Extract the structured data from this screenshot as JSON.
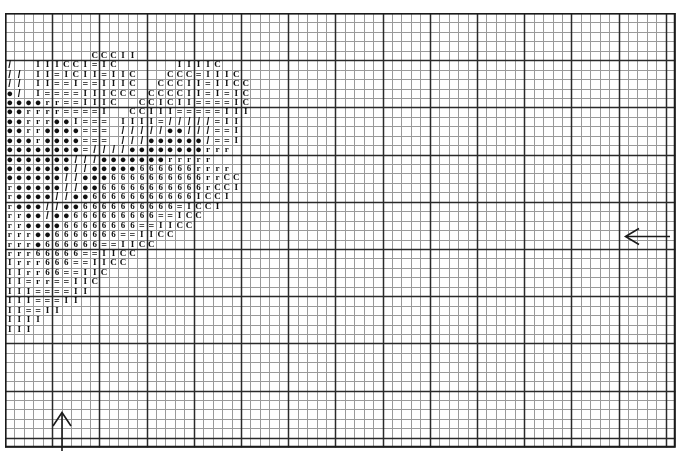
{
  "document": {
    "type": "cross-stitch-pattern-chart",
    "title": "Cross Stitch Pattern Chart",
    "background_color": "#ffffff",
    "ink_color": "#101010"
  },
  "grid": {
    "columns": 71,
    "rows": 46,
    "cell_size_px": 9.44,
    "origin_x_px": 5,
    "origin_y_px": 13,
    "width_px": 671,
    "height_px": 435,
    "minor_line_color": "#9a9a9a",
    "major_line_color": "#2a2a2a",
    "major_line_every": 5,
    "border_color": "#1a1a1a"
  },
  "markers": {
    "center_arrow_right": {
      "label": "vertical-center-marker",
      "direction": "left",
      "x_px": 622,
      "y_px": 236,
      "color": "#1a1a1a"
    },
    "center_arrow_bottom": {
      "label": "horizontal-center-marker",
      "direction": "up",
      "x_px": 62,
      "y_px": 409,
      "color": "#1a1a1a"
    }
  },
  "symbol_legend": [
    {
      "symbol": "C",
      "name": "letter-c-symbol"
    },
    {
      "symbol": "I",
      "name": "letter-i-symbol"
    },
    {
      "symbol": "=",
      "name": "equals-symbol"
    },
    {
      "symbol": "-",
      "name": "dash-symbol"
    },
    {
      "symbol": "/",
      "name": "slash-symbol"
    },
    {
      "symbol": "●",
      "name": "filled-dot-symbol"
    },
    {
      "symbol": "r",
      "name": "letter-r-symbol"
    },
    {
      "symbol": "6",
      "name": "digit-six-symbol"
    },
    {
      "symbol": "0",
      "name": "digit-zero-symbol"
    },
    {
      "symbol": ")",
      "name": "paren-symbol"
    },
    {
      "symbol": "$",
      "name": "dollar-symbol"
    }
  ],
  "chart_data": {
    "type": "heatmap",
    "xlabel": "",
    "ylabel": "",
    "grid": true,
    "legend_position": "none",
    "columns": 71,
    "rows": 46,
    "cells": [
      "",
      "",
      "",
      "",
      "                  C C C I I",
      "/     I I I C C I = I C             I I I I C",
      "/ /   I I = I C I I = I I C       C C C = I I I C",
      "/ /   I I = = I = = I I I C     C C C I I = I I C C",
      "● /   I = = = = I I I C C C   C C C C I I = I = I C",
      "● ● ● ● r r = = I I I C     C C I C I I = = = = I C",
      "● ● r r r r = = = = I     C C I I I = = = = = I I I",
      "● ● r r r ● ● I = = =   I I I I = / / / / / = I I",
      "● ● r r ● ● ● ● = = =   / / / / / ● ● / / / = = I",
      "● ● ● r ● ● ● ● = = =   / / / ● ● ● ● ● ● / = = I",
      "● ● ● ● ● ● ● ● = / / / / ● ● ● ● ● ● ● ● r r r",
      "● ● ● ● ● ● ● / / / ● ● ● ● ● ● ● r r r r r",
      "● ● ● ● ● ● ● / / ● ● ● ● ● 6 6 6 6 6 6 r r r r",
      "● ● ● ● ● ● / / ● ● ● 6 6 6 6 6 6 6 6 6 6 r r C C",
      "r ● ● ● ● ● / / ● ● 6 6 6 6 6 6 6 6 6 6 6 r C C I",
      "r ● ● ● ● / / ● ● 6 6 6 6 6 6 6 6 6 6 6 I C C I",
      "r ● ● ● / / ● ● 6 6 6 6 6 6 6 6 6 6 = I C C I",
      "r r ● ● / ● ● 6 6 6 6 6 6 6 6 6 = = I C C",
      "r r ● ● ● ● 6 6 6 6 6 6 6 6 = = I I C C",
      "r r r ● ● 6 6 6 6 6 6 6 = = I I C C",
      "r r r ● 6 6 6 6 6 6 = = I I C C",
      "r r r 6 6 6 6 6 = = I I C C",
      "I r r r 6 6 6 = = I I C C",
      "I I r r 6 6 = = I I C",
      "I I = r r = = I I C",
      "I I I = = = = I I",
      "I I I = = = I I",
      "I I = = I I",
      "I I I I",
      "I I I",
      "",
      "",
      "",
      "",
      "",
      "",
      "",
      "",
      "",
      "",
      "",
      ""
    ]
  }
}
